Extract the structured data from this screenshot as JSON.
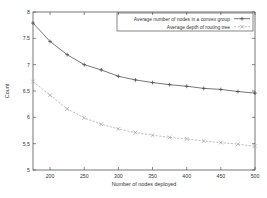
{
  "chart_data": {
    "type": "line",
    "title": "",
    "xlabel": "Number of nodes deployed",
    "ylabel": "Count",
    "xlim": [
      175,
      500
    ],
    "ylim": [
      5,
      8
    ],
    "grid": false,
    "legend_position": "top-right",
    "xticks": [
      200,
      250,
      300,
      350,
      400,
      450,
      500
    ],
    "xtick_labels": [
      "200",
      "250",
      "300",
      "350",
      "400",
      "450",
      "500"
    ],
    "yticks": [
      5,
      5.5,
      6,
      6.5,
      7,
      7.5,
      8
    ],
    "ytick_labels": [
      "5",
      "5.5",
      "6",
      "6.5",
      "7",
      "7.5",
      "8"
    ],
    "x": [
      175,
      200,
      225,
      250,
      275,
      300,
      325,
      350,
      375,
      400,
      425,
      450,
      475,
      500
    ],
    "series": [
      {
        "name": "Average number of nodes in a convex group",
        "marker": "plus",
        "linestyle": "solid",
        "color": "#4a4a4a",
        "values": [
          7.79,
          7.44,
          7.19,
          7.0,
          6.9,
          6.78,
          6.71,
          6.66,
          6.62,
          6.59,
          6.55,
          6.53,
          6.49,
          6.46
        ]
      },
      {
        "name": "Average depth of routing tree",
        "marker": "cross",
        "linestyle": "dashed",
        "color": "#a8a8a8",
        "values": [
          6.68,
          6.42,
          6.16,
          5.99,
          5.87,
          5.78,
          5.71,
          5.66,
          5.62,
          5.59,
          5.55,
          5.52,
          5.49,
          5.45
        ]
      }
    ]
  },
  "axes": {
    "x_title": "Number of nodes deployed",
    "y_title": "Count"
  },
  "legend": {
    "entries": [
      {
        "label": "Average number of nodes in a convex group"
      },
      {
        "label": "Average depth of routing tree"
      }
    ]
  }
}
